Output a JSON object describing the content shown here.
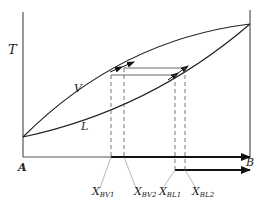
{
  "diagram": {
    "axis": {
      "y_label": "T",
      "left_end": "A",
      "right_end": "B"
    },
    "curves": {
      "vapor": "V",
      "liquid": "L"
    },
    "compositions": [
      {
        "main": "X",
        "sub": "BV1"
      },
      {
        "main": "X",
        "sub": "BV2"
      },
      {
        "main": "X",
        "sub": "BL1"
      },
      {
        "main": "X",
        "sub": "BL2"
      }
    ],
    "colors": {
      "line": "#222222",
      "dash": "#555555"
    }
  }
}
